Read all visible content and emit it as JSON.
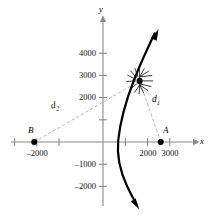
{
  "figure": {
    "type": "hyperbola-branch-diagram",
    "axes": {
      "x_label": "x",
      "y_label": "y",
      "x_ticks": [
        {
          "value": -3000,
          "label": ""
        },
        {
          "value": -2000,
          "label": "–2000"
        },
        {
          "value": -1000,
          "label": ""
        },
        {
          "value": 1000,
          "label": ""
        },
        {
          "value": 2000,
          "label": "2000"
        },
        {
          "value": 3000,
          "label": "3000"
        }
      ],
      "y_ticks": [
        {
          "value": 4000,
          "label": "4000"
        },
        {
          "value": 3000,
          "label": "3000"
        },
        {
          "value": 2000,
          "label": "2000"
        },
        {
          "value": 1000,
          "label": ""
        },
        {
          "value": -1000,
          "label": "–1000"
        },
        {
          "value": -2000,
          "label": "–2000"
        }
      ]
    },
    "points": [
      {
        "name": "A",
        "label": "A",
        "x": 2600,
        "y": 0
      },
      {
        "name": "B",
        "label": "B",
        "x": -2200,
        "y": 0
      }
    ],
    "burst": {
      "name": "explosion",
      "x": 1650,
      "y": 2750
    },
    "distances": [
      {
        "name": "d1",
        "base": "d",
        "sub": "1",
        "from": "A",
        "to": "explosion"
      },
      {
        "name": "d2",
        "base": "d",
        "sub": "2",
        "from": "B",
        "to": "explosion"
      }
    ],
    "colors": {
      "axis": "#8a8a8a",
      "curve": "#000000",
      "dashed": "#a8a8a8",
      "text": "#111111",
      "point": "#000000"
    }
  }
}
